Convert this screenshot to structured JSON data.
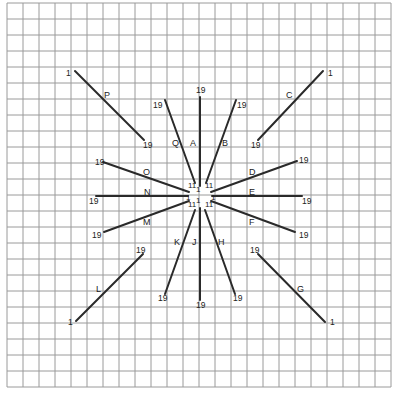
{
  "diagram": {
    "title": "",
    "grid": {
      "x_start": 7,
      "y_start": 3,
      "spacing": 16,
      "columns": 24,
      "rows": 24,
      "color": "#9a9a9a"
    },
    "line_color": "#2a2a2a",
    "lines": [
      {
        "id": "A",
        "x1": 200,
        "y1": 97,
        "x2": 200,
        "y2": 186,
        "start_label": "19",
        "end_label": "11",
        "letter": "A"
      },
      {
        "id": "B",
        "x1": 236,
        "y1": 100,
        "x2": 206,
        "y2": 183,
        "start_label": "19",
        "end_label": "11",
        "letter": "B"
      },
      {
        "id": "C",
        "x1": 323,
        "y1": 71,
        "x2": 258,
        "y2": 140,
        "start_label": "1",
        "end_label": "19",
        "letter": "C"
      },
      {
        "id": "D",
        "x1": 297,
        "y1": 161,
        "x2": 211,
        "y2": 192,
        "start_label": "19",
        "end_label": "1",
        "letter": "D"
      },
      {
        "id": "E",
        "x1": 302,
        "y1": 196,
        "x2": 212,
        "y2": 196,
        "start_label": "19",
        "end_label": "1",
        "letter": "E"
      },
      {
        "id": "F",
        "x1": 295,
        "y1": 232,
        "x2": 211,
        "y2": 201,
        "start_label": "19",
        "end_label": "1",
        "letter": "F"
      },
      {
        "id": "G",
        "x1": 325,
        "y1": 322,
        "x2": 258,
        "y2": 254,
        "start_label": "1",
        "end_label": "19",
        "letter": "G"
      },
      {
        "id": "H",
        "x1": 235,
        "y1": 294,
        "x2": 205,
        "y2": 210,
        "start_label": "19",
        "end_label": "1",
        "letter": "H"
      },
      {
        "id": "J",
        "x1": 200,
        "y1": 300,
        "x2": 200,
        "y2": 208,
        "start_label": "19",
        "end_label": "1",
        "letter": "J"
      },
      {
        "id": "K",
        "x1": 165,
        "y1": 294,
        "x2": 195,
        "y2": 210,
        "start_label": "19",
        "end_label": "1",
        "letter": "K"
      },
      {
        "id": "L",
        "x1": 76,
        "y1": 321,
        "x2": 143,
        "y2": 254,
        "start_label": "1",
        "end_label": "19",
        "letter": "L"
      },
      {
        "id": "M",
        "x1": 104,
        "y1": 232,
        "x2": 189,
        "y2": 201,
        "start_label": "19",
        "end_label": "1",
        "letter": "M"
      },
      {
        "id": "N",
        "x1": 96,
        "y1": 196,
        "x2": 188,
        "y2": 196,
        "start_label": "19",
        "end_label": "1",
        "letter": "N"
      },
      {
        "id": "O",
        "x1": 103,
        "y1": 162,
        "x2": 189,
        "y2": 192,
        "start_label": "19",
        "end_label": "11",
        "letter": "O"
      },
      {
        "id": "P",
        "x1": 75,
        "y1": 71,
        "x2": 144,
        "y2": 140,
        "start_label": "1",
        "end_label": "19",
        "letter": "P"
      },
      {
        "id": "Q",
        "x1": 165,
        "y1": 100,
        "x2": 195,
        "y2": 183,
        "start_label": "19",
        "end_label": "11",
        "letter": "Q"
      }
    ],
    "labels": [
      {
        "text": "1",
        "x": 66,
        "y": 76,
        "cls": "lbl"
      },
      {
        "text": "P",
        "x": 104,
        "y": 98,
        "cls": "letter"
      },
      {
        "text": "19",
        "x": 143,
        "y": 148,
        "cls": "lbl"
      },
      {
        "text": "19",
        "x": 153,
        "y": 108,
        "cls": "lbl"
      },
      {
        "text": "Q",
        "x": 172,
        "y": 146,
        "cls": "letter"
      },
      {
        "text": "19",
        "x": 196,
        "y": 93,
        "cls": "lbl"
      },
      {
        "text": "A",
        "x": 190,
        "y": 146,
        "cls": "letter"
      },
      {
        "text": "19",
        "x": 237,
        "y": 108,
        "cls": "lbl"
      },
      {
        "text": "B",
        "x": 222,
        "y": 146,
        "cls": "letter"
      },
      {
        "text": "C",
        "x": 286,
        "y": 98,
        "cls": "letter"
      },
      {
        "text": "1",
        "x": 328,
        "y": 76,
        "cls": "lbl"
      },
      {
        "text": "19",
        "x": 251,
        "y": 148,
        "cls": "lbl"
      },
      {
        "text": "19",
        "x": 95,
        "y": 165,
        "cls": "lbl"
      },
      {
        "text": "O",
        "x": 143,
        "y": 175,
        "cls": "letter"
      },
      {
        "text": "D",
        "x": 249,
        "y": 175,
        "cls": "letter"
      },
      {
        "text": "19",
        "x": 299,
        "y": 163,
        "cls": "lbl"
      },
      {
        "text": "N",
        "x": 144,
        "y": 195,
        "cls": "letter"
      },
      {
        "text": "19",
        "x": 89,
        "y": 204,
        "cls": "lbl"
      },
      {
        "text": "E",
        "x": 249,
        "y": 195,
        "cls": "letter"
      },
      {
        "text": "19",
        "x": 302,
        "y": 204,
        "cls": "lbl"
      },
      {
        "text": "M",
        "x": 143,
        "y": 225,
        "cls": "letter"
      },
      {
        "text": "19",
        "x": 92,
        "y": 238,
        "cls": "lbl"
      },
      {
        "text": "F",
        "x": 249,
        "y": 225,
        "cls": "letter"
      },
      {
        "text": "19",
        "x": 299,
        "y": 238,
        "cls": "lbl"
      },
      {
        "text": "19",
        "x": 136,
        "y": 253,
        "cls": "lbl"
      },
      {
        "text": "19",
        "x": 250,
        "y": 253,
        "cls": "lbl"
      },
      {
        "text": "K",
        "x": 174,
        "y": 245,
        "cls": "letter"
      },
      {
        "text": "J",
        "x": 192,
        "y": 245,
        "cls": "letter"
      },
      {
        "text": "H",
        "x": 218,
        "y": 245,
        "cls": "letter"
      },
      {
        "text": "L",
        "x": 96,
        "y": 292,
        "cls": "letter"
      },
      {
        "text": "G",
        "x": 297,
        "y": 292,
        "cls": "letter"
      },
      {
        "text": "19",
        "x": 158,
        "y": 301,
        "cls": "lbl"
      },
      {
        "text": "19",
        "x": 196,
        "y": 308,
        "cls": "lbl"
      },
      {
        "text": "19",
        "x": 233,
        "y": 301,
        "cls": "lbl"
      },
      {
        "text": "1",
        "x": 68,
        "y": 325,
        "cls": "lbl"
      },
      {
        "text": "1",
        "x": 330,
        "y": 325,
        "cls": "lbl"
      },
      {
        "text": "11",
        "x": 188,
        "y": 188,
        "cls": "tiny"
      },
      {
        "text": "11",
        "x": 205,
        "y": 188,
        "cls": "tiny"
      },
      {
        "text": "1",
        "x": 196,
        "y": 192,
        "cls": "tiny"
      },
      {
        "text": "1",
        "x": 186,
        "y": 200,
        "cls": "tiny"
      },
      {
        "text": "1",
        "x": 211,
        "y": 200,
        "cls": "tiny"
      },
      {
        "text": "11",
        "x": 188,
        "y": 207,
        "cls": "tiny"
      },
      {
        "text": "11",
        "x": 205,
        "y": 207,
        "cls": "tiny"
      },
      {
        "text": "1",
        "x": 196,
        "y": 203,
        "cls": "tiny"
      }
    ]
  }
}
